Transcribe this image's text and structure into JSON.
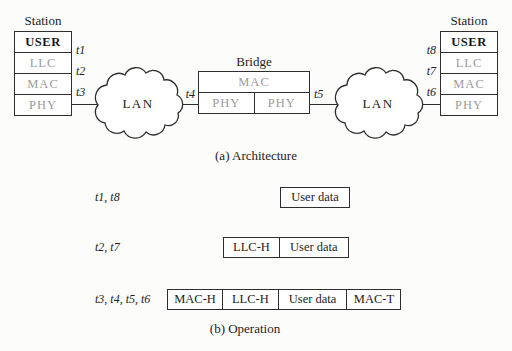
{
  "architecture": {
    "caption": "(a) Architecture",
    "left_station": {
      "title": "Station",
      "layers": [
        "USER",
        "LLC",
        "MAC",
        "PHY"
      ],
      "time_labels": [
        "t1",
        "t2",
        "t3"
      ]
    },
    "right_station": {
      "title": "Station",
      "layers": [
        "USER",
        "LLC",
        "MAC",
        "PHY"
      ],
      "time_labels": [
        "t8",
        "t7",
        "t6"
      ]
    },
    "bridge": {
      "title": "Bridge",
      "mac_label": "MAC",
      "phy_left": "PHY",
      "phy_right": "PHY",
      "left_time_label": "t4",
      "right_time_label": "t5"
    },
    "left_lan": "LAN",
    "right_lan": "LAN"
  },
  "operation": {
    "caption": "(b) Operation",
    "rows": [
      {
        "label": "t1, t8",
        "segments": [
          "User data"
        ]
      },
      {
        "label": "t2, t7",
        "segments": [
          "LLC-H",
          "User data"
        ]
      },
      {
        "label": "t3, t4, t5, t6",
        "segments": [
          "MAC-H",
          "LLC-H",
          "User data",
          "MAC-T"
        ]
      }
    ]
  },
  "colors": {
    "background": "#fcfcfb",
    "line": "#2e2e2e",
    "gray_layer_text": "#9b9b9b",
    "black_text": "#1c1c1c"
  }
}
